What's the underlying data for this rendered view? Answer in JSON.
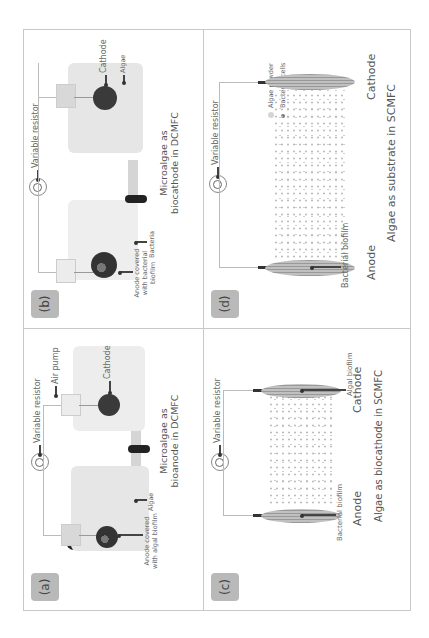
{
  "figure": {
    "orientation": "rotated 90 degrees counter-clockwise",
    "colors": {
      "border": "#c8c8c8",
      "badge": "#b9b9b9",
      "electrode": "#3a3a3a",
      "membrane": "#222222"
    }
  },
  "panels": {
    "a": {
      "badge": "(a)",
      "variable_resistor": "Variable resistor",
      "air_pump": "Air pump",
      "cathode": "Cathode",
      "anode": "Anode covered with algal biofilm",
      "algae": "Algae",
      "caption": "Microalgae as bioanode in DCMFC",
      "icons": [
        "moon-icon",
        "variable-resistor-icon"
      ]
    },
    "b": {
      "badge": "(b)",
      "variable_resistor": "Variable resistor",
      "cathode": "Cathode",
      "algae": "Algae",
      "anode": "Anode covered with bacterial biofilm",
      "bacteria": "Bacteria",
      "caption": "Microalgae as biocathode in DCMFC",
      "icons": [
        "variable-resistor-icon"
      ]
    },
    "c": {
      "badge": "(c)",
      "variable_resistor": "Variable resistor",
      "algal_biofilm": "Algal biofilm",
      "cathode": "Cathode",
      "bacterial_biofilm": "Bacterial biofilm",
      "anode": "Anode",
      "caption": "Algae as biocathode in SCMFC",
      "icons": [
        "variable-resistor-icon"
      ]
    },
    "d": {
      "badge": "(d)",
      "variable_resistor": "Variable resistor",
      "legend": [
        {
          "label": "Algae powder",
          "color": "#d5d5d5"
        },
        {
          "label": "Bacterial cells",
          "color": "#777777"
        }
      ],
      "cathode": "Cathode",
      "bacterial_biofilm": "Bacterial biofilm",
      "anode": "Anode",
      "caption": "Algae as substrate in SCMFC",
      "icons": [
        "variable-resistor-icon"
      ]
    }
  }
}
